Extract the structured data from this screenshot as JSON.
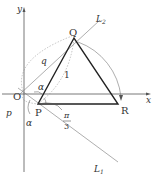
{
  "diagram": {
    "axes": {
      "x_label": "x",
      "y_label": "y",
      "origin_label": "O"
    },
    "points": {
      "P": "P",
      "Q": "Q",
      "R": "R"
    },
    "lines": {
      "L1": "L",
      "L1_sub": "1",
      "L2": "L",
      "L2_sub": "2"
    },
    "lengths": {
      "PQ": "1",
      "OQ": "q",
      "OP": "p"
    },
    "angles": {
      "alpha_top": "α",
      "alpha_bottom": "α",
      "pi": "π",
      "three": "3"
    },
    "colors": {
      "triangle": "#222222",
      "axes": "#555555",
      "thin": "#777777"
    }
  }
}
